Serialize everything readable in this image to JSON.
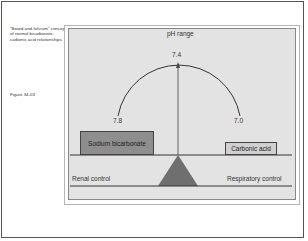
{
  "caption": {
    "text": "\"Board-and-fulcrum\" concept of normal bicarbonate-carbonic acid relationships.",
    "figure_label": "Figure 34-03"
  },
  "diagram": {
    "title": "pH range",
    "ph_center": "7.4",
    "ph_left": "7.8",
    "ph_right": "7.0",
    "left_box": "Sodium bicarbonate",
    "right_box": "Carbonic acid",
    "left_control": "Renal control",
    "right_control": "Respiratory control",
    "colors": {
      "panel": "#e3e3e3",
      "left_box_fill": "#8e8e8e",
      "right_box_fill": "#d0d0d0",
      "fulcrum": "#6f6f6f",
      "lines": "#333333"
    }
  }
}
